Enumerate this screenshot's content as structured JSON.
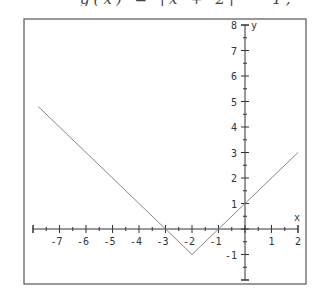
{
  "title_fragment": "g(x) = |x + 2| − 1,",
  "chart_data": {
    "type": "line",
    "title": "g(x) = |x + 2| − 1",
    "xlabel": "x",
    "ylabel": "y",
    "xlim": [
      -8,
      2
    ],
    "ylim": [
      -2,
      8
    ],
    "grid": false,
    "x_ticks": [
      -7,
      -6,
      -5,
      -4,
      -3,
      -2,
      -1,
      1,
      2
    ],
    "y_ticks": [
      -1,
      1,
      2,
      3,
      4,
      5,
      6,
      7,
      8
    ],
    "minor_ticks_per_unit": 2,
    "series": [
      {
        "name": "g(x) = |x + 2| − 1",
        "x": [
          -7.8,
          -2,
          2
        ],
        "y": [
          4.8,
          -1,
          3
        ],
        "color": "#888888"
      }
    ],
    "key_points": {
      "vertex": [
        -2,
        -1
      ],
      "x_intercepts": [
        -3,
        -1
      ],
      "y_intercept": [
        0,
        1
      ]
    }
  },
  "plot": {
    "frame": {
      "left": 24,
      "top": 19,
      "right": 306,
      "bottom": 284
    },
    "origin_px": [
      245,
      229
    ],
    "x_scale": 26.5,
    "y_scale": 25.5,
    "axis_color": "#333333",
    "frame_color": "#555555",
    "curve_color": "#888888"
  }
}
